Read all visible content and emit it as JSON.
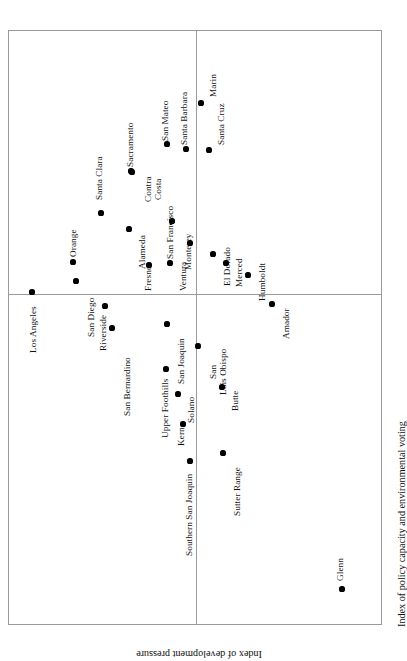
{
  "figure": {
    "orientation": "rotated-90",
    "frame_color": "#9a9a9a",
    "marker_color": "#000000",
    "background": "#ffffff"
  },
  "axes": {
    "x_title": "Index of policy capacity and environmental voting",
    "y_title": "Index of development pressure"
  },
  "chart_data": {
    "type": "scatter",
    "title": "",
    "xlabel": "Index of policy capacity and environmental voting",
    "ylabel": "Index of development pressure",
    "xlim": [
      0,
      100
    ],
    "ylim": [
      0,
      100
    ],
    "grid": false,
    "legend": null,
    "quadrant_lines": {
      "x": 50.0,
      "y": 44.2
    },
    "note": "Axis tick labels are not printed on the figure; x/y values below are read off marker positions as percentages of the plot frame (x increases to the right, y increases upward).",
    "points": [
      {
        "label": "Los Angeles",
        "x": 16.0,
        "y": 95.0
      },
      {
        "label": "Orange",
        "x": 40.4,
        "y": 81.0
      },
      {
        "label": "San Diego",
        "x": 36.5,
        "y": 80.5
      },
      {
        "label": "Riverside",
        "x": 21.5,
        "y": 75.8
      },
      {
        "label": "San Bernardino",
        "x": 18.1,
        "y": 68.6
      },
      {
        "label": "Santa Clara",
        "x": 65.1,
        "y": 63.4
      },
      {
        "label": "Alameda",
        "x": 59.5,
        "y": 58.7
      },
      {
        "label": "Sacramento",
        "x": 62.8,
        "y": 52.8
      },
      {
        "label": "Contra Costa",
        "x": 62.5,
        "y": 52.3
      },
      {
        "label": "San Mateo",
        "x": 72.3,
        "y": 44.7
      },
      {
        "label": "Santa Barbara",
        "x": 73.7,
        "y": 35.4
      },
      {
        "label": "Marin",
        "x": 84.5,
        "y": 31.1
      },
      {
        "label": "Santa Cruz",
        "x": 76.1,
        "y": 23.4
      },
      {
        "label": "San Francisco",
        "x": 56.6,
        "y": 47.6
      },
      {
        "label": "Monterey",
        "x": 53.5,
        "y": 38.3
      },
      {
        "label": "Ventura",
        "x": 50.1,
        "y": 44.0
      },
      {
        "label": "Fresno",
        "x": 49.8,
        "y": 52.9
      },
      {
        "label": "El Dorado",
        "x": 50.4,
        "y": 25.9
      },
      {
        "label": "Merced",
        "x": 47.6,
        "y": 20.3
      },
      {
        "label": "Humboldt",
        "x": 43.5,
        "y": 14.8
      },
      {
        "label": "Upper Foothills",
        "x": 26.4,
        "y": 55.5
      },
      {
        "label": "San Joaquin",
        "x": 35.5,
        "y": 61.4
      },
      {
        "label": "Solano",
        "x": 22.6,
        "y": 57.2
      },
      {
        "label": "Kern",
        "x": 15.0,
        "y": 54.4
      },
      {
        "label": "San Luis Obispo",
        "x": 33.4,
        "y": 48.9
      },
      {
        "label": "Butte",
        "x": 25.3,
        "y": 42.9
      },
      {
        "label": "Southern San Joaquin",
        "x": 22.5,
        "y": 29.9
      },
      {
        "label": "Sutter Range",
        "x": 14.4,
        "y": 31.7
      },
      {
        "label": "Amador",
        "x": 31.4,
        "y": 10.8
      },
      {
        "label": "Glenn",
        "x": 3.3,
        "y": 13.5
      }
    ]
  },
  "points": [
    {
      "name": "los-angeles",
      "label": "Los Angeles",
      "px": 31,
      "py": 291,
      "lx": 28,
      "ly": 352,
      "multiline": false
    },
    {
      "name": "orange",
      "label": "Orange",
      "px": 72,
      "py": 261,
      "lx": 68,
      "ly": 256,
      "multiline": false
    },
    {
      "name": "san-diego",
      "label": "San Diego",
      "px": 75,
      "py": 280,
      "lx": 86,
      "ly": 336,
      "multiline": false
    },
    {
      "name": "riverside",
      "label": "Riverside",
      "px": 104,
      "py": 305,
      "lx": 98,
      "ly": 350,
      "multiline": false
    },
    {
      "name": "san-bernardino",
      "label": "San Bernardino",
      "px": 111,
      "py": 327,
      "lx": 122,
      "ly": 415,
      "multiline": false
    },
    {
      "name": "santa-clara",
      "label": "Santa Clara",
      "px": 100,
      "py": 212,
      "lx": 94,
      "ly": 199,
      "multiline": false
    },
    {
      "name": "alameda",
      "label": "Alameda",
      "px": 128,
      "py": 228,
      "lx": 137,
      "ly": 268,
      "multiline": false
    },
    {
      "name": "sacramento",
      "label": "Sacramento",
      "px": 130,
      "py": 170,
      "lx": 125,
      "ly": 166,
      "multiline": false
    },
    {
      "name": "contra-costa",
      "label": "Contra Costa",
      "px": 131,
      "py": 171,
      "lx": 143,
      "ly": 201,
      "multiline": true
    },
    {
      "name": "san-mateo",
      "label": "San Mateo",
      "px": 166,
      "py": 143,
      "lx": 160,
      "ly": 140,
      "multiline": false
    },
    {
      "name": "santa-barbara",
      "label": "Santa Barbara",
      "px": 185,
      "py": 148,
      "lx": 179,
      "ly": 144,
      "multiline": false
    },
    {
      "name": "marin",
      "label": "Marin",
      "px": 200,
      "py": 102,
      "lx": 208,
      "ly": 96,
      "multiline": false
    },
    {
      "name": "santa-cruz",
      "label": "Santa Cruz",
      "px": 208,
      "py": 149,
      "lx": 216,
      "ly": 144,
      "multiline": false
    },
    {
      "name": "san-francisco",
      "label": "San Francisco",
      "px": 171,
      "py": 220,
      "lx": 165,
      "ly": 258,
      "multiline": false
    },
    {
      "name": "monterey",
      "label": "Monterey",
      "px": 189,
      "py": 242,
      "lx": 183,
      "ly": 269,
      "multiline": false
    },
    {
      "name": "ventura",
      "label": "Ventura",
      "px": 169,
      "py": 262,
      "lx": 178,
      "ly": 290,
      "multiline": false
    },
    {
      "name": "fresno",
      "label": "Fresno",
      "px": 148,
      "py": 264,
      "lx": 143,
      "ly": 290,
      "multiline": false
    },
    {
      "name": "el-dorado",
      "label": "El Dorado",
      "px": 212,
      "py": 253,
      "lx": 222,
      "ly": 285,
      "multiline": false
    },
    {
      "name": "merced",
      "label": "Merced",
      "px": 225,
      "py": 262,
      "lx": 234,
      "ly": 286,
      "multiline": false
    },
    {
      "name": "humboldt",
      "label": "Humboldt",
      "px": 247,
      "py": 274,
      "lx": 257,
      "ly": 300,
      "multiline": false
    },
    {
      "name": "upper-foothills",
      "label": "Upper Foothills",
      "px": 165,
      "py": 368,
      "lx": 160,
      "ly": 437,
      "multiline": false
    },
    {
      "name": "san-joaquin",
      "label": "San Joaquin",
      "px": 166,
      "py": 323,
      "lx": 176,
      "ly": 383,
      "multiline": false
    },
    {
      "name": "solano",
      "label": "Solano",
      "px": 177,
      "py": 393,
      "lx": 186,
      "ly": 422,
      "multiline": false
    },
    {
      "name": "kern",
      "label": "Kern",
      "px": 182,
      "py": 423,
      "lx": 176,
      "ly": 445,
      "multiline": false
    },
    {
      "name": "san-luis-obispo",
      "label": "San Luis Obispo",
      "px": 197,
      "py": 345,
      "lx": 208,
      "ly": 394,
      "multiline": true
    },
    {
      "name": "butte",
      "label": "Butte",
      "px": 221,
      "py": 386,
      "lx": 230,
      "ly": 410,
      "multiline": false
    },
    {
      "name": "southern-san-joaquin",
      "label": "Southern San Joaquin",
      "px": 189,
      "py": 460,
      "lx": 184,
      "ly": 555,
      "multiline": false
    },
    {
      "name": "sutter-range",
      "label": "Sutter Range",
      "px": 222,
      "py": 452,
      "lx": 232,
      "ly": 515,
      "multiline": false
    },
    {
      "name": "amador",
      "label": "Amador",
      "px": 271,
      "py": 303,
      "lx": 281,
      "ly": 338,
      "multiline": false
    },
    {
      "name": "glenn",
      "label": "Glenn",
      "px": 341,
      "py": 588,
      "lx": 335,
      "ly": 580,
      "multiline": false
    }
  ]
}
